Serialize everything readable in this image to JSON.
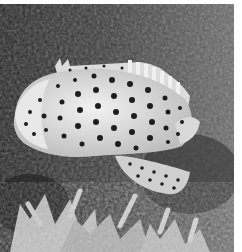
{
  "image": {
    "subject": "spotted grouper fish swimming over coral reef",
    "style": "grayscale photograph",
    "colors": {
      "background_dark": "#2a2a2a",
      "background_mid": "#5a5a5a",
      "fish_body": "#e6e6e6",
      "spots": "#1e1e1e",
      "coral": "#cfcfcf",
      "border": "#ffffff"
    }
  }
}
